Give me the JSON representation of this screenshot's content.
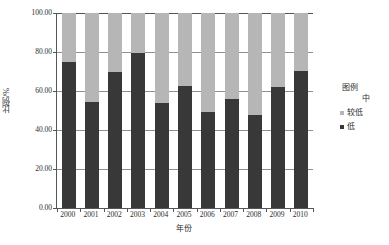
{
  "chart_data": {
    "type": "bar",
    "stacked": true,
    "title": "",
    "xlabel": "年份",
    "ylabel": "比例/%",
    "categories": [
      "2000",
      "2001",
      "2002",
      "2003",
      "2004",
      "2005",
      "2006",
      "2007",
      "2008",
      "2009",
      "2010"
    ],
    "ylim": [
      0,
      100
    ],
    "yticks": [
      0,
      20,
      40,
      60,
      80,
      100
    ],
    "ytick_labels": [
      "0.00",
      "20.00",
      "40.00",
      "60.00",
      "80.00",
      "100.00"
    ],
    "grid": true,
    "legend_position": "right",
    "series": [
      {
        "name": "低",
        "color": "#383838",
        "values": [
          75.0,
          54.5,
          69.5,
          79.5,
          54.0,
          62.5,
          49.0,
          56.0,
          47.5,
          62.0,
          70.5
        ]
      },
      {
        "name": "较低",
        "color": "#b6b6b6",
        "values": [
          25.0,
          45.5,
          30.5,
          20.5,
          46.0,
          37.5,
          51.0,
          44.0,
          52.5,
          38.0,
          29.5
        ]
      }
    ]
  },
  "legend": {
    "title": "图例",
    "subtitle": "中",
    "entries": [
      {
        "label": "较低",
        "color": "#b6b6b6"
      },
      {
        "label": "低",
        "color": "#383838"
      }
    ]
  },
  "axes": {
    "y_title": "比例/%",
    "x_title": "年份"
  }
}
